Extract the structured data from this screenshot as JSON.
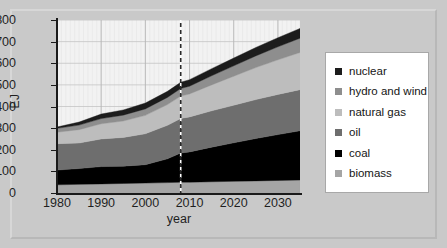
{
  "figure": {
    "background": "#c9c9c9",
    "plot_background": "#f2f2f2",
    "frame_border": "#d7d7d7"
  },
  "legend": {
    "position": "right",
    "items": [
      {
        "label": "nuclear",
        "color": "#1c1c1c"
      },
      {
        "label": "hydro and wind",
        "color": "#8e8e8e"
      },
      {
        "label": "natural gas",
        "color": "#bdbdbd"
      },
      {
        "label": "oil",
        "color": "#6e6e6e"
      },
      {
        "label": "coal",
        "color": "#000000"
      },
      {
        "label": "biomass",
        "color": "#a5a5a5"
      }
    ]
  },
  "chart_data": {
    "type": "area",
    "stacked": true,
    "title": "",
    "xlabel": "year",
    "ylabel": "EJ",
    "xlim": [
      1980,
      2035
    ],
    "ylim": [
      0,
      800
    ],
    "ytick_step": 100,
    "yticks": [
      0,
      100,
      200,
      300,
      400,
      500,
      600,
      700,
      800
    ],
    "xticks": [
      1980,
      1990,
      2000,
      2010,
      2020,
      2030
    ],
    "xtick_labels": [
      "1980",
      "1990",
      "2000",
      "2010",
      "2020",
      "2030"
    ],
    "grid": true,
    "annotations": [
      {
        "type": "vline",
        "x": 2008,
        "style": "dashed",
        "color": "#ffffff",
        "note": "history / projection divider"
      }
    ],
    "x": [
      1980,
      1985,
      1990,
      1995,
      2000,
      2005,
      2008,
      2010,
      2015,
      2020,
      2025,
      2030,
      2035
    ],
    "series": [
      {
        "name": "biomass",
        "color": "#a5a5a5",
        "values": [
          38,
          40,
          42,
          44,
          46,
          48,
          50,
          50,
          52,
          54,
          56,
          58,
          60
        ]
      },
      {
        "name": "coal",
        "color": "#000000",
        "values": [
          68,
          73,
          80,
          80,
          85,
          110,
          135,
          140,
          160,
          178,
          196,
          212,
          228
        ]
      },
      {
        "name": "oil",
        "color": "#6e6e6e",
        "values": [
          122,
          118,
          128,
          133,
          143,
          155,
          160,
          162,
          168,
          174,
          180,
          186,
          190
        ]
      },
      {
        "name": "natural gas",
        "color": "#bdbdbd",
        "values": [
          53,
          62,
          70,
          76,
          85,
          96,
          103,
          106,
          120,
          134,
          148,
          160,
          172
        ]
      },
      {
        "name": "hydro and wind",
        "color": "#8e8e8e",
        "values": [
          18,
          21,
          24,
          27,
          30,
          33,
          35,
          36,
          42,
          48,
          54,
          60,
          66
        ]
      },
      {
        "name": "nuclear",
        "color": "#1c1c1c",
        "values": [
          6,
          14,
          21,
          24,
          27,
          28,
          29,
          30,
          33,
          36,
          39,
          42,
          45
        ]
      }
    ],
    "totals": [
      305,
      328,
      365,
      384,
      416,
      470,
      512,
      524,
      575,
      624,
      673,
      718,
      761
    ]
  }
}
